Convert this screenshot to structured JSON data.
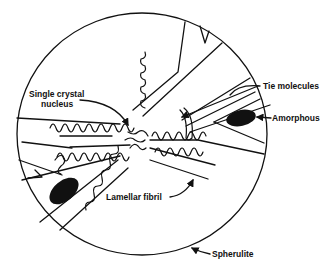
{
  "diagram": {
    "type": "spherulite-structure",
    "labels": {
      "single_crystal_nucleus_1": "Single crystal",
      "single_crystal_nucleus_2": "nucleus",
      "tie_molecules": "Tie molecules",
      "amorphous": "Amorphous",
      "lamellar_fibril": "Lamellar fibril",
      "spherulite": "Spherulite"
    },
    "colors": {
      "ink": "#111111",
      "background": "#ffffff"
    }
  }
}
